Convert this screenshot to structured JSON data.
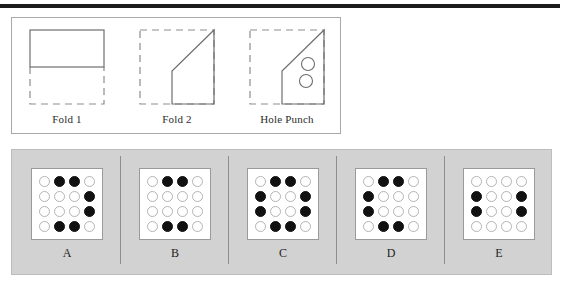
{
  "top_rule": {
    "color": "#1c1c1c"
  },
  "prompt": {
    "panel_name": "fold-sequence-panel",
    "steps": [
      {
        "caption": "Fold 1",
        "art": "square-folded-up-half",
        "description": "Solid rectangle occupying top half, dashed square outline below indicating original sheet folded upward"
      },
      {
        "caption": "Fold 2",
        "art": "square-diagonal-fold-to-top-right",
        "description": "Dashed square outline with solid polygon: diagonal crease from mid-left up to top-right corner"
      },
      {
        "caption": "Hole Punch",
        "art": "folded-shape-with-two-holes",
        "description": "Same folded polygon with two small punched circles in the right region",
        "holes": 2
      }
    ]
  },
  "options": {
    "panel_name": "answer-options-panel",
    "background_color": "#d2d2d2",
    "grid_size": 4,
    "legend": {
      "open": "unpunched hole",
      "filled": "punched hole"
    },
    "items": [
      {
        "label": "A",
        "grid": [
          [
            "open",
            "filled",
            "filled",
            "open"
          ],
          [
            "open",
            "open",
            "open",
            "filled"
          ],
          [
            "open",
            "open",
            "open",
            "filled"
          ],
          [
            "open",
            "filled",
            "filled",
            "open"
          ]
        ]
      },
      {
        "label": "B",
        "grid": [
          [
            "open",
            "filled",
            "filled",
            "open"
          ],
          [
            "open",
            "open",
            "open",
            "open"
          ],
          [
            "open",
            "open",
            "open",
            "open"
          ],
          [
            "open",
            "filled",
            "filled",
            "open"
          ]
        ]
      },
      {
        "label": "C",
        "grid": [
          [
            "open",
            "filled",
            "filled",
            "open"
          ],
          [
            "filled",
            "open",
            "open",
            "filled"
          ],
          [
            "filled",
            "open",
            "open",
            "filled"
          ],
          [
            "open",
            "filled",
            "filled",
            "open"
          ]
        ]
      },
      {
        "label": "D",
        "grid": [
          [
            "open",
            "filled",
            "filled",
            "open"
          ],
          [
            "filled",
            "open",
            "open",
            "open"
          ],
          [
            "filled",
            "open",
            "open",
            "open"
          ],
          [
            "open",
            "filled",
            "filled",
            "open"
          ]
        ]
      },
      {
        "label": "E",
        "grid": [
          [
            "open",
            "open",
            "open",
            "open"
          ],
          [
            "filled",
            "open",
            "open",
            "filled"
          ],
          [
            "filled",
            "open",
            "open",
            "filled"
          ],
          [
            "open",
            "open",
            "open",
            "open"
          ]
        ]
      }
    ]
  }
}
